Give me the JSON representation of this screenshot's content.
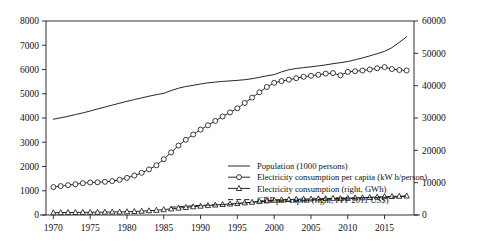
{
  "chart_data": {
    "type": "line",
    "title": "",
    "xlabel": "",
    "ylabel": "",
    "xlim": [
      1969,
      2019
    ],
    "ylim": [
      0,
      8000
    ],
    "y2lim": [
      0,
      60000
    ],
    "grid": false,
    "legend_position": "bottom-center",
    "xticks": [
      "1970",
      "1975",
      "1980",
      "1985",
      "1990",
      "1995",
      "2000",
      "2005",
      "2010",
      "2015"
    ],
    "xtick_values": [
      1970,
      1975,
      1980,
      1985,
      1990,
      1995,
      2000,
      2005,
      2010,
      2015
    ],
    "yticks": [
      "0",
      "1000",
      "2000",
      "3000",
      "4000",
      "5000",
      "6000",
      "7000",
      "8000"
    ],
    "ytick_values": [
      0,
      1000,
      2000,
      3000,
      4000,
      5000,
      6000,
      7000,
      8000
    ],
    "y2ticks": [
      "0",
      "10000",
      "20000",
      "30000",
      "40000",
      "50000",
      "60000"
    ],
    "y2tick_values": [
      0,
      10000,
      20000,
      30000,
      40000,
      50000,
      60000
    ],
    "x": [
      1970,
      1971,
      1972,
      1973,
      1974,
      1975,
      1976,
      1977,
      1978,
      1979,
      1980,
      1981,
      1982,
      1983,
      1984,
      1985,
      1986,
      1987,
      1988,
      1989,
      1990,
      1991,
      1992,
      1993,
      1994,
      1995,
      1996,
      1997,
      1998,
      1999,
      2000,
      2001,
      2002,
      2003,
      2004,
      2005,
      2006,
      2007,
      2008,
      2009,
      2010,
      2011,
      2012,
      2013,
      2014,
      2015,
      2016,
      2017,
      2018
    ],
    "series": [
      {
        "name": "Population (1000 persons)",
        "axis": "left",
        "style": "solid",
        "marker": "none",
        "color": "#1a1a1a",
        "values": [
          3950,
          4010,
          4070,
          4140,
          4210,
          4290,
          4370,
          4450,
          4530,
          4610,
          4690,
          4760,
          4830,
          4900,
          4960,
          5020,
          5130,
          5230,
          5300,
          5350,
          5400,
          5450,
          5480,
          5510,
          5530,
          5550,
          5580,
          5620,
          5680,
          5740,
          5790,
          5900,
          5990,
          6040,
          6080,
          6110,
          6150,
          6190,
          6240,
          6280,
          6330,
          6400,
          6480,
          6560,
          6650,
          6750,
          6900,
          7120,
          7350
        ]
      },
      {
        "name": "Electricity consumption per capita (kW h/person)",
        "axis": "left",
        "style": "solid",
        "marker": "circle",
        "color": "#1a1a1a",
        "values": [
          1150,
          1190,
          1230,
          1270,
          1310,
          1340,
          1350,
          1370,
          1400,
          1450,
          1530,
          1630,
          1740,
          1880,
          2050,
          2300,
          2580,
          2860,
          3100,
          3320,
          3520,
          3700,
          3880,
          4060,
          4230,
          4400,
          4620,
          4840,
          5060,
          5280,
          5450,
          5520,
          5580,
          5640,
          5700,
          5740,
          5780,
          5830,
          5850,
          5760,
          5900,
          5930,
          5960,
          6000,
          6050,
          6100,
          6020,
          5980,
          5960
        ]
      },
      {
        "name": "Electricity consumption (right, GWh)",
        "axis": "right",
        "style": "solid",
        "marker": "triangle",
        "color": "#1a1a1a",
        "values": [
          700,
          730,
          770,
          800,
          830,
          850,
          870,
          890,
          920,
          960,
          1020,
          1100,
          1200,
          1320,
          1470,
          1680,
          1900,
          2130,
          2350,
          2560,
          2760,
          2930,
          3100,
          3260,
          3420,
          3580,
          3760,
          3960,
          4180,
          4400,
          4570,
          4690,
          4800,
          4880,
          4940,
          4990,
          5040,
          5100,
          5150,
          5070,
          5200,
          5280,
          5360,
          5450,
          5560,
          5680,
          5740,
          5800,
          5900
        ]
      },
      {
        "name": "GDP per capita (right, PPP 2011 US$)",
        "axis": "right",
        "style": "dashed",
        "marker": "none",
        "color": "#1a1a1a",
        "start_index": 16,
        "values": [
          null,
          null,
          null,
          null,
          null,
          null,
          null,
          null,
          null,
          null,
          null,
          null,
          null,
          null,
          null,
          null,
          2380,
          2560,
          2720,
          2880,
          3000,
          3060,
          3120,
          3200,
          3320,
          3500,
          3720,
          3960,
          4180,
          4320,
          4400,
          4300,
          4300,
          4380,
          4520,
          4660,
          4800,
          4900,
          4960,
          4920,
          5040,
          5200,
          5300,
          5380,
          5420,
          5460,
          5520,
          5620,
          5760
        ]
      }
    ],
    "legend": [
      {
        "label": "Population (1000 persons)",
        "marker": "none",
        "style": "solid"
      },
      {
        "label": "Electricity consumption per capita (kW h/person)",
        "marker": "circle",
        "style": "solid"
      },
      {
        "label": "Electricity consumption (right, GWh)",
        "marker": "triangle",
        "style": "solid"
      },
      {
        "label": "GDP per capita (right, PPP 2011 US$)",
        "marker": "none",
        "style": "dashed"
      }
    ]
  }
}
